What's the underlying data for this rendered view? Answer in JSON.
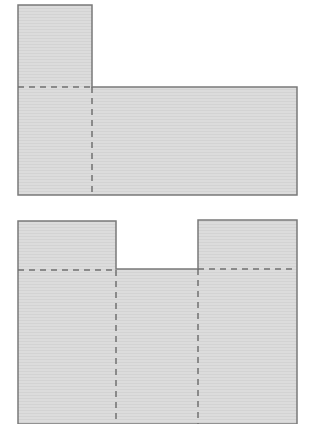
{
  "colors": {
    "fill": "#dcdcdc",
    "stripe": "#d2d2d2",
    "outline": "#7a7a7a",
    "fold": "#707070",
    "background": "#ffffff"
  },
  "figures": [
    {
      "name": "l-shaped-net",
      "outline_points": "18,5 92,5 92,87 297,87 297,195 18,195",
      "fold_lines": [
        {
          "x1": 18,
          "y1": 87,
          "x2": 92,
          "y2": 87
        },
        {
          "x1": 92,
          "y1": 87,
          "x2": 92,
          "y2": 195
        }
      ]
    },
    {
      "name": "notched-net",
      "outline_points": "18,424 18,221 116,221 116,269 198,269 198,220 297,220 297,424",
      "fold_lines": [
        {
          "x1": 18,
          "y1": 270,
          "x2": 116,
          "y2": 270
        },
        {
          "x1": 198,
          "y1": 269,
          "x2": 297,
          "y2": 269
        },
        {
          "x1": 116,
          "y1": 270,
          "x2": 116,
          "y2": 424
        },
        {
          "x1": 198,
          "y1": 269,
          "x2": 198,
          "y2": 424
        }
      ]
    }
  ]
}
